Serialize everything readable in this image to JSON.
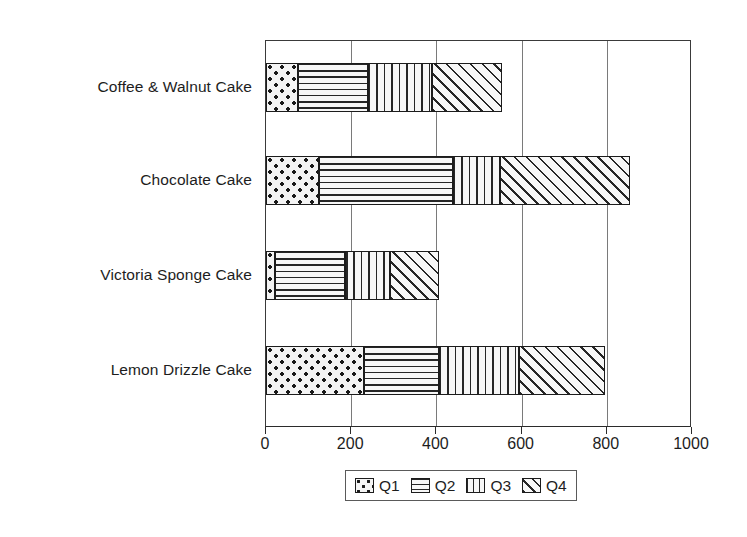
{
  "chart_data": {
    "type": "bar",
    "orientation": "horizontal",
    "stacked": true,
    "title": "",
    "subtitle": "",
    "xlabel": "",
    "ylabel": "",
    "xlim": [
      0,
      1000
    ],
    "xticks": [
      0,
      200,
      400,
      600,
      800,
      1000
    ],
    "xtick_labels": [
      "0",
      "200",
      "400",
      "600",
      "800",
      "1000"
    ],
    "grid": "vertical",
    "legend_position": "bottom",
    "categories": [
      "Coffee & Walnut Cake",
      "Chocolate Cake",
      "Victoria Sponge Cake",
      "Lemon Drizzle Cake"
    ],
    "series": [
      {
        "name": "Q1",
        "pattern": "dots",
        "values": [
          75,
          125,
          20,
          230
        ]
      },
      {
        "name": "Q2",
        "pattern": "horizontal-lines",
        "values": [
          165,
          315,
          165,
          175
        ]
      },
      {
        "name": "Q3",
        "pattern": "vertical-lines",
        "values": [
          150,
          110,
          105,
          190
        ]
      },
      {
        "name": "Q4",
        "pattern": "diagonal-hatch",
        "values": [
          165,
          305,
          115,
          200
        ]
      }
    ],
    "totals": [
      555,
      855,
      405,
      795
    ],
    "legend_entries": [
      "Q1",
      "Q2",
      "Q3",
      "Q4"
    ],
    "colors": {
      "pattern_ink": "#1c1c1c",
      "pattern_fill": "#f7f7f7",
      "axis": "#2b2b2b",
      "grid": "#7a7a7a",
      "text": "#1d1d1d"
    }
  }
}
